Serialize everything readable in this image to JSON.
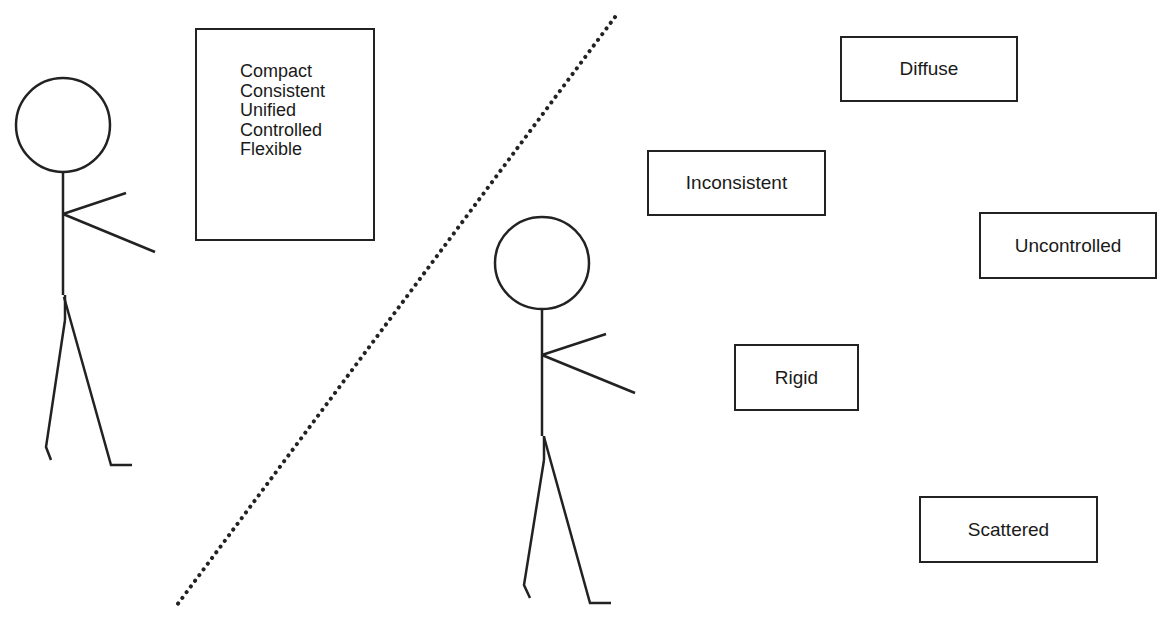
{
  "diagram": {
    "left_group": {
      "box_items": [
        "Compact",
        "Consistent",
        "Unified",
        "Controlled",
        "Flexible"
      ]
    },
    "right_group": {
      "boxes": [
        {
          "label": "Diffuse"
        },
        {
          "label": "Inconsistent"
        },
        {
          "label": "Uncontrolled"
        },
        {
          "label": "Rigid"
        },
        {
          "label": "Scattered"
        }
      ]
    },
    "divider": {
      "style": "dotted"
    },
    "colors": {
      "stroke": "#222222",
      "background": "#ffffff"
    }
  }
}
